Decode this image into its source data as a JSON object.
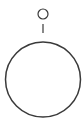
{
  "diagram": {
    "stroke_color": "#3a3a3a",
    "background": "#ffffff",
    "elements": {
      "small_circle": {
        "cx": 43,
        "cy": 14,
        "r": 5
      },
      "connector_line": {
        "x": 43,
        "y1": 24,
        "y2": 33
      },
      "large_circle": {
        "cx": 43,
        "cy": 79.5,
        "r": 37.5
      }
    }
  }
}
